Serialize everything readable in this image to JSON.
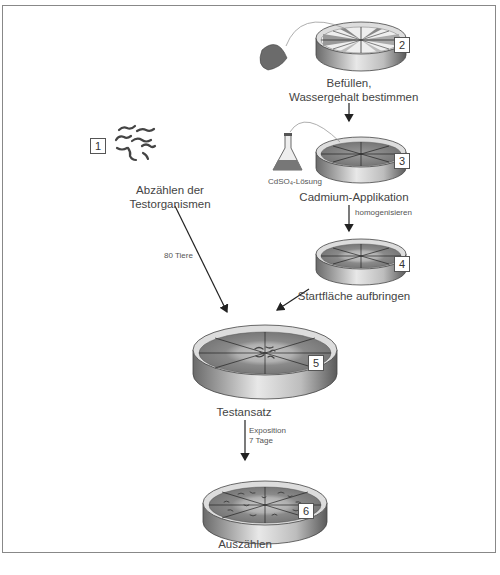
{
  "diagram": {
    "steps": [
      {
        "number": "1",
        "label_lines": [
          "Abzählen der",
          "Testorganismen"
        ]
      },
      {
        "number": "2",
        "label_lines": [
          "Befüllen,",
          "Wassergehalt bestimmen"
        ]
      },
      {
        "number": "3",
        "label_lines": [
          "Cadmium-Applikation"
        ],
        "reagent_label": "CdSO₄-Lösung"
      },
      {
        "number": "4",
        "label_lines": [
          "Startfläche aufbringen"
        ]
      },
      {
        "number": "5",
        "label_lines": [
          "Testansatz"
        ]
      },
      {
        "number": "6",
        "label_lines": [
          "Auszählen"
        ]
      }
    ],
    "arrow_labels": {
      "step1_to_5": "80 Tiere",
      "step3_to_4": "homogenisieren",
      "step5_to_6_line1": "Exposition",
      "step5_to_6_line2": "7 Tage"
    }
  }
}
